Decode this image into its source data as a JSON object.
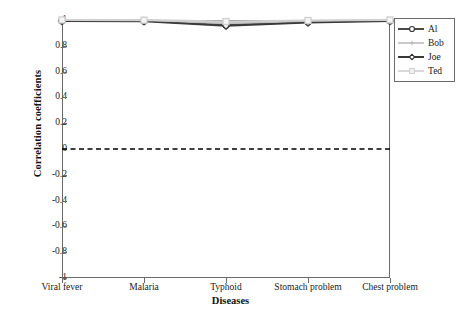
{
  "chart_data": {
    "type": "line",
    "title": "",
    "xlabel": "Diseases",
    "ylabel": "Correlation coefficients",
    "categories": [
      "Viral fever",
      "Malaria",
      "Typhoid",
      "Stomach problem",
      "Chest problem"
    ],
    "ylim": [
      -1,
      1
    ],
    "yticks": [
      1,
      0.8,
      0.6,
      0.4,
      0.2,
      0,
      -0.2,
      -0.4,
      -0.6,
      -0.8,
      -1
    ],
    "ytick_labels": [
      "1",
      "0.8",
      "0.6",
      "0.4",
      "0.2",
      "0",
      "-0.2",
      "-0.4",
      "-0.6",
      "-0.8",
      "-1"
    ],
    "grid": false,
    "legend_position": "upper right",
    "reference_line": {
      "y": 0,
      "style": "dashed",
      "color": "#000000"
    },
    "series": [
      {
        "name": "Al",
        "values": [
          0.995,
          0.993,
          0.962,
          0.985,
          0.995
        ],
        "color": "#4a4a4a",
        "marker": "circle"
      },
      {
        "name": "Bob",
        "values": [
          0.998,
          0.996,
          0.978,
          0.992,
          0.998
        ],
        "color": "#bdbdbd",
        "marker": "plus"
      },
      {
        "name": "Joe",
        "values": [
          0.992,
          0.99,
          0.955,
          0.98,
          0.992
        ],
        "color": "#3a3a3a",
        "marker": "diamond"
      },
      {
        "name": "Ted",
        "values": [
          1.0,
          0.999,
          0.988,
          0.996,
          1.0
        ],
        "color": "#cfcfcf",
        "marker": "square"
      }
    ]
  },
  "legend": {
    "entries": [
      {
        "label": "Al"
      },
      {
        "label": "Bob"
      },
      {
        "label": "Joe"
      },
      {
        "label": "Ted"
      }
    ]
  }
}
